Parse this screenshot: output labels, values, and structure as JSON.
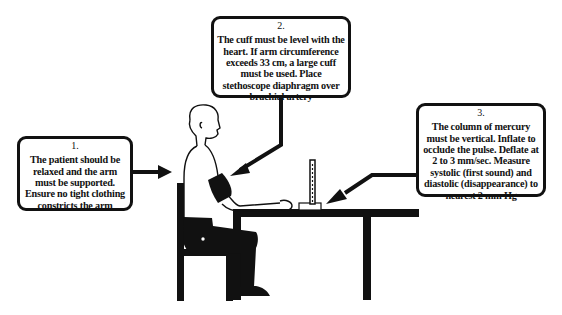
{
  "figure": {
    "callouts": [
      {
        "number": "1.",
        "text": "The patient should be relaxed and the arm must be supported. Ensure no tight clothing constricts the arm"
      },
      {
        "number": "2.",
        "text": "The cuff must be level with the heart. If arm circumference exceeds 33 cm, a large cuff must be used. Place stethoscope diaphragm over brachial artery"
      },
      {
        "number": "3.",
        "text": "The column of mercury must be vertical. Inflate to occlude the pulse. Deflate at 2 to 3 mm/sec. Measure systolic (first sound) and diastolic (disappearance) to nearest 2 mm Hg"
      }
    ],
    "colors": {
      "ink": "#111111",
      "background": "#ffffff"
    }
  }
}
